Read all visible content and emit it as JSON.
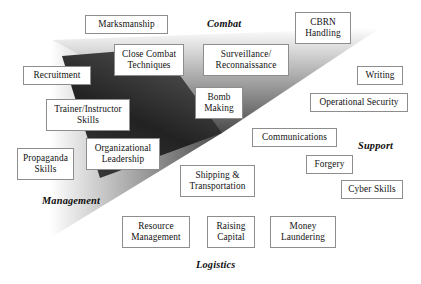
{
  "diagram": {
    "width": 421,
    "height": 284,
    "background": "#ffffff",
    "box_border_color": "#8d8d8d",
    "box_fill": "#ffffff",
    "shade_dark": "#2d2d2d",
    "shade_mid": "#8a8a8a",
    "shade_light": "#ffffff"
  },
  "quadrant_labels": [
    {
      "id": "combat",
      "text": "Combat",
      "x": 207,
      "y": 18
    },
    {
      "id": "support",
      "text": "Support",
      "x": 358,
      "y": 140
    },
    {
      "id": "logistics",
      "text": "Logistics",
      "x": 196,
      "y": 259
    },
    {
      "id": "management",
      "text": "Management",
      "x": 42,
      "y": 195
    }
  ],
  "skill_boxes": [
    {
      "id": "marksmanship",
      "label": "Marksmanship",
      "quadrant": "combat",
      "x": 85,
      "y": 15,
      "w": 83,
      "h": 19
    },
    {
      "id": "cbrn-handling",
      "label": "CBRN\nHandling",
      "quadrant": "combat",
      "x": 295,
      "y": 12,
      "w": 56,
      "h": 32
    },
    {
      "id": "close-combat-techniques",
      "label": "Close Combat\nTechniques",
      "quadrant": "combat",
      "x": 114,
      "y": 44,
      "w": 70,
      "h": 32
    },
    {
      "id": "surveillance-recon",
      "label": "Surveillance/\nReconnaissance",
      "quadrant": "combat",
      "x": 203,
      "y": 44,
      "w": 86,
      "h": 32
    },
    {
      "id": "bomb-making",
      "label": "Bomb\nMaking",
      "quadrant": "combat",
      "x": 195,
      "y": 87,
      "w": 48,
      "h": 32
    },
    {
      "id": "recruitment",
      "label": "Recruitment",
      "quadrant": "management",
      "x": 23,
      "y": 66,
      "w": 68,
      "h": 19
    },
    {
      "id": "trainer-instructor",
      "label": "Trainer/Instructor\nSkills",
      "quadrant": "management",
      "x": 46,
      "y": 99,
      "w": 84,
      "h": 32
    },
    {
      "id": "organizational-leadership",
      "label": "Organizational\nLeadership",
      "quadrant": "management",
      "x": 86,
      "y": 138,
      "w": 74,
      "h": 32
    },
    {
      "id": "propaganda-skills",
      "label": "Propaganda\nSkills",
      "quadrant": "management",
      "x": 17,
      "y": 148,
      "w": 57,
      "h": 32
    },
    {
      "id": "writing",
      "label": "Writing",
      "quadrant": "support",
      "x": 357,
      "y": 66,
      "w": 46,
      "h": 19
    },
    {
      "id": "operational-security",
      "label": "Operational Security",
      "quadrant": "support",
      "x": 310,
      "y": 93,
      "w": 98,
      "h": 19
    },
    {
      "id": "communications",
      "label": "Communications",
      "quadrant": "support",
      "x": 252,
      "y": 128,
      "w": 85,
      "h": 19
    },
    {
      "id": "forgery",
      "label": "Forgery",
      "quadrant": "support",
      "x": 306,
      "y": 155,
      "w": 47,
      "h": 19
    },
    {
      "id": "cyber-skills",
      "label": "Cyber Skills",
      "quadrant": "support",
      "x": 341,
      "y": 180,
      "w": 62,
      "h": 19
    },
    {
      "id": "shipping-transportation",
      "label": "Shipping &\nTransportation",
      "quadrant": "logistics",
      "x": 180,
      "y": 165,
      "w": 75,
      "h": 32
    },
    {
      "id": "resource-management",
      "label": "Resource\nManagement",
      "quadrant": "logistics",
      "x": 122,
      "y": 216,
      "w": 68,
      "h": 32
    },
    {
      "id": "raising-capital",
      "label": "Raising\nCapital",
      "quadrant": "logistics",
      "x": 207,
      "y": 216,
      "w": 48,
      "h": 32
    },
    {
      "id": "money-laundering",
      "label": "Money\nLaundering",
      "quadrant": "logistics",
      "x": 270,
      "y": 216,
      "w": 66,
      "h": 32
    }
  ]
}
